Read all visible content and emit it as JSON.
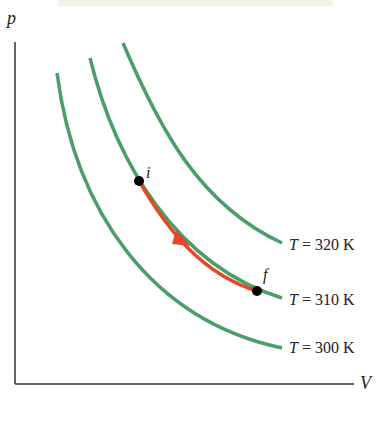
{
  "axes": {
    "y_label": "p",
    "x_label": "V"
  },
  "isotherms": [
    {
      "label_var": "T",
      "label_text": " = 320 K",
      "color": "#4a9e6a"
    },
    {
      "label_var": "T",
      "label_text": " = 310 K",
      "color": "#4a9e6a"
    },
    {
      "label_var": "T",
      "label_text": " = 300 K",
      "color": "#4a9e6a"
    }
  ],
  "process": {
    "color": "#e8462a",
    "start_label": "i",
    "end_label": "f"
  }
}
